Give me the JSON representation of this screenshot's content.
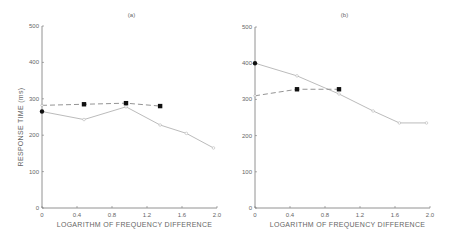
{
  "chart_data": [
    {
      "type": "line",
      "title": "(a)",
      "xlabel": "LOGARITHM OF FREQUENCY DIFFERENCE",
      "ylabel": "RESPONSE TIME (ms)",
      "xlim": [
        0,
        2.0
      ],
      "ylim": [
        0,
        500
      ],
      "xticks": [
        "0",
        "0.4",
        "0.8",
        "1.2",
        "1.6",
        "2.0"
      ],
      "yticks": [
        "0",
        "100",
        "200",
        "300",
        "400",
        "500"
      ],
      "grid": false,
      "series": [
        {
          "name": "solid (open circles)",
          "style": "solid",
          "x": [
            0,
            0.48,
            0.96,
            1.35,
            1.65,
            1.96
          ],
          "y": [
            265,
            243,
            278,
            228,
            205,
            165
          ]
        },
        {
          "name": "dashed (filled squares)",
          "style": "dashed",
          "x": [
            0,
            0.48,
            0.96,
            1.35
          ],
          "y": [
            282,
            285,
            288,
            280
          ]
        }
      ]
    },
    {
      "type": "line",
      "title": "(b)",
      "xlabel": "LOGARITHM OF FREQUENCY DIFFERENCE",
      "ylabel": "",
      "xlim": [
        0,
        2.0
      ],
      "ylim": [
        0,
        500
      ],
      "xticks": [
        "0",
        "0.4",
        "0.8",
        "1.2",
        "1.6",
        "2.0"
      ],
      "yticks": [
        "0",
        "100",
        "200",
        "300",
        "400",
        "500"
      ],
      "grid": false,
      "series": [
        {
          "name": "solid (open circles)",
          "style": "solid",
          "x": [
            0,
            0.48,
            0.96,
            1.35,
            1.65,
            1.96
          ],
          "y": [
            400,
            365,
            315,
            268,
            235,
            235
          ]
        },
        {
          "name": "dashed (filled squares)",
          "style": "dashed",
          "x": [
            0,
            0.48,
            0.96
          ],
          "y": [
            310,
            328,
            328
          ]
        }
      ]
    }
  ],
  "labels": {
    "panel_a": "(a)",
    "panel_b": "(b)",
    "xlabel": "LOGARITHM   OF   FREQUENCY   DIFFERENCE",
    "ylabel": "RESPONSE   TIME   (ms)"
  }
}
